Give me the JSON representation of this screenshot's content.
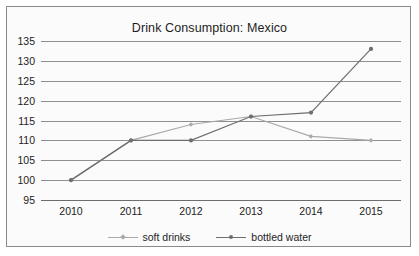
{
  "chart_data": {
    "type": "line",
    "title": "Drink Consumption: Mexico",
    "xlabel": "",
    "ylabel": "",
    "categories": [
      "2010",
      "2011",
      "2012",
      "2013",
      "2014",
      "2015"
    ],
    "series": [
      {
        "name": "soft drinks",
        "color": "#a9a9a9",
        "marker": "diamond",
        "values": [
          100,
          110,
          114,
          116,
          111,
          110
        ]
      },
      {
        "name": "bottled water",
        "color": "#6e6e6e",
        "marker": "circle",
        "values": [
          100,
          110,
          110,
          116,
          117,
          133
        ]
      }
    ],
    "ylim": [
      95,
      135
    ],
    "yticks": [
      95,
      100,
      105,
      110,
      115,
      120,
      125,
      130,
      135
    ],
    "ytick_labels": [
      "95",
      "100",
      "105",
      "110",
      "115",
      "120",
      "125",
      "130",
      "135"
    ],
    "grid": true,
    "legend_position": "bottom"
  },
  "legend": {
    "entries": [
      {
        "label": "soft drinks"
      },
      {
        "label": "bottled water"
      }
    ]
  }
}
